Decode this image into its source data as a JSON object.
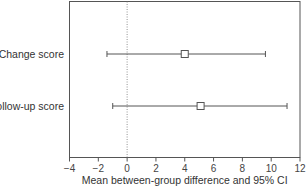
{
  "chart_data": {
    "type": "forest",
    "title": "",
    "xlabel": "Mean between-group difference and 95% CI",
    "ylabel": "",
    "xlim": [
      -4,
      12
    ],
    "xticks": [
      -4,
      -2,
      0,
      2,
      4,
      6,
      8,
      10,
      12
    ],
    "xtick_labels": [
      "−4",
      "−2",
      "0",
      "2",
      "4",
      "6",
      "8",
      "10",
      "12"
    ],
    "reference_line": 0,
    "grid": false,
    "categories": [
      "Change score",
      "Follow-up score"
    ],
    "series": [
      {
        "name": "Mean between-group difference",
        "points": [
          {
            "label": "Change score",
            "estimate": 4.0,
            "ci_low": -1.4,
            "ci_high": 9.6
          },
          {
            "label": "Follow-up score",
            "estimate": 5.1,
            "ci_low": -1.0,
            "ci_high": 11.1
          }
        ]
      }
    ],
    "colors": {
      "line": "#555555",
      "frame": "#555555",
      "reference": "#777777",
      "marker_fill": "#ffffff"
    }
  }
}
